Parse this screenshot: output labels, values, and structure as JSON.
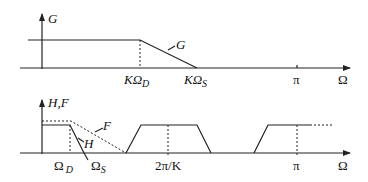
{
  "top_plot": {
    "y_axis_label": "G",
    "curve_label": "G",
    "x_ticks": {
      "k_omega_d": {
        "main": "KΩ",
        "sub": "D"
      },
      "k_omega_s": {
        "main": "KΩ",
        "sub": "S"
      },
      "pi": "π"
    },
    "x_axis_label": "Ω"
  },
  "bottom_plot": {
    "y_axis_label": "H,F",
    "curve_labels": {
      "F": "F",
      "H": "H"
    },
    "x_ticks": {
      "omega_d": {
        "main": "Ω",
        "sub": "D"
      },
      "omega_s": {
        "main": "Ω",
        "sub": "S"
      },
      "two_pi_over_k": "2π/K",
      "pi": "π"
    },
    "x_axis_label": "Ω"
  },
  "colors": {
    "line": "#222222",
    "background": "#ffffff"
  }
}
